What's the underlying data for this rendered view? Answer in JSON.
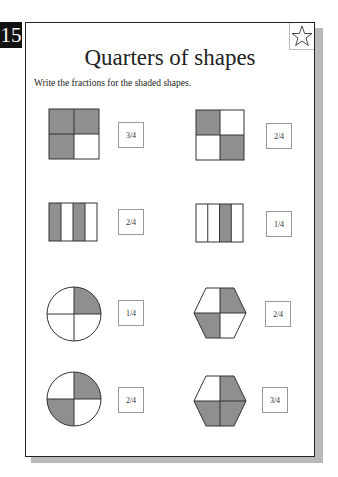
{
  "page_number": "15",
  "title": "Quarters of shapes",
  "instruction": "Write the fractions for the shaded shapes.",
  "colors": {
    "shade": "#8f8f8f",
    "line": "#333333",
    "badge_bg": "#111111"
  },
  "exercises": [
    {
      "shape": "square-grid",
      "shaded_quarters": [
        "top-left",
        "top-right",
        "bottom-left"
      ],
      "answer": "3/4"
    },
    {
      "shape": "square-grid",
      "shaded_quarters": [
        "top-left",
        "bottom-right"
      ],
      "answer": "2/4"
    },
    {
      "shape": "vertical-strips",
      "shaded_quarters": [
        "strip-1",
        "strip-3"
      ],
      "answer": "2/4"
    },
    {
      "shape": "vertical-strips",
      "shaded_quarters": [
        "strip-3"
      ],
      "answer": "1/4"
    },
    {
      "shape": "circle",
      "shaded_quarters": [
        "top-right"
      ],
      "answer": "1/4"
    },
    {
      "shape": "hexagon",
      "shaded_quarters": [
        "top-right",
        "bottom-left"
      ],
      "answer": "2/4"
    },
    {
      "shape": "circle",
      "shaded_quarters": [
        "top-right",
        "bottom-left"
      ],
      "answer": "2/4"
    },
    {
      "shape": "hexagon",
      "shaded_quarters": [
        "top-right",
        "bottom-left",
        "bottom-right"
      ],
      "answer": "3/4"
    }
  ]
}
